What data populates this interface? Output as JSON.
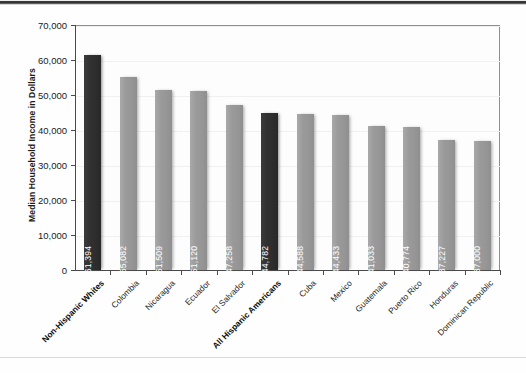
{
  "chart_data": {
    "type": "bar",
    "title": "",
    "xlabel": "",
    "ylabel": "Median Household Income in Dollars",
    "ylim": [
      0,
      70000
    ],
    "ytick_values": [
      0,
      10000,
      20000,
      30000,
      40000,
      50000,
      60000,
      70000
    ],
    "ytick_labels": [
      "0",
      "10,000",
      "20,000",
      "30,000",
      "40,000",
      "50,000",
      "60,000",
      "70,000"
    ],
    "grid": true,
    "legend": "none",
    "categories": [
      "Non-Hispanic Whites",
      "Colombia",
      "Nicaragua",
      "Ecuador",
      "El Salvador",
      "All Hispanic Americans",
      "Cuba",
      "Mexico",
      "Guatemala",
      "Puerto Rico",
      "Honduras",
      "Dominican Republic"
    ],
    "values": [
      61394,
      55082,
      51509,
      51120,
      47258,
      44782,
      44588,
      44433,
      41033,
      40774,
      37227,
      37000
    ],
    "data_labels": [
      "$61,394",
      "$55,082",
      "$51,509",
      "$51,120",
      "$47,258",
      "$44,782",
      "$44,588",
      "$44,433",
      "$41,033",
      "$40,774",
      "$37,227",
      "$37,000"
    ],
    "highlighted": [
      "Non-Hispanic Whites",
      "All Hispanic Americans"
    ],
    "colors": {
      "bar": "#969696",
      "bar_highlight": "#2d2d2d",
      "data_label_text": "#ffffff",
      "axis": "#4a4a4a",
      "grid": "#f0f0f0",
      "text": "#1a1a1a",
      "background": "#fefefe"
    }
  }
}
